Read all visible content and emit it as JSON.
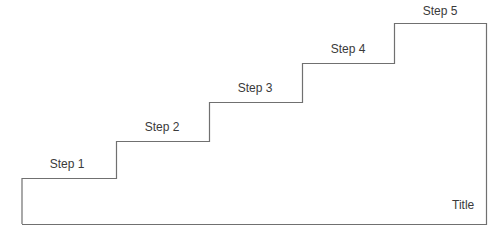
{
  "diagram": {
    "type": "staircase",
    "line_color": "#707070",
    "text_color": "#3a3a3a",
    "title": "Title",
    "steps": [
      {
        "label": "Step 1",
        "level": 1
      },
      {
        "label": "Step 2",
        "level": 2
      },
      {
        "label": "Step 3",
        "level": 3
      },
      {
        "label": "Step 4",
        "level": 4
      },
      {
        "label": "Step 5",
        "level": 5
      }
    ]
  }
}
